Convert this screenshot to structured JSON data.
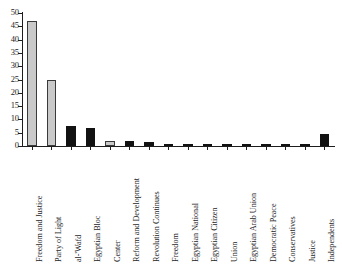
{
  "chart_data": {
    "type": "bar",
    "title": "",
    "subtitle": "",
    "xlabel": "",
    "ylabel": "",
    "ylim": [
      0,
      50
    ],
    "ytick_step": 5,
    "yticks": [
      0,
      5,
      10,
      15,
      20,
      25,
      30,
      35,
      40,
      45,
      50
    ],
    "grid": false,
    "legend": "none",
    "categories": [
      "Freedom and Justice",
      "Party of Light",
      "al-'Wafd",
      "Egyptian Bloc",
      "Center",
      "Reform and Development",
      "Revolution Continues",
      "Freedom",
      "Egyptian National",
      "Egyptian Citizen",
      "Union",
      "Egyptian Arab Union",
      "Democratic Peace",
      "Conservatives",
      "Justice",
      "Independents"
    ],
    "values": [
      47,
      24.7,
      7.5,
      6.9,
      2.0,
      1.8,
      1.4,
      0.9,
      0.9,
      0.8,
      0.4,
      0.2,
      0.2,
      0.2,
      0.2,
      4.5
    ],
    "bar_colors": [
      "#c9c9c9",
      "#c9c9c9",
      "#121212",
      "#121212",
      "#c9c9c9",
      "#121212",
      "#121212",
      "#121212",
      "#121212",
      "#121212",
      "#121212",
      "#121212",
      "#121212",
      "#121212",
      "#121212",
      "#121212"
    ],
    "colors": {
      "light_bar": "#c9c9c9",
      "dark_bar": "#121212",
      "axis": "#1d1d1d",
      "background": "#ffffff"
    }
  }
}
